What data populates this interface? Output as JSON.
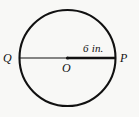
{
  "figure": {
    "type": "circle-diameter-diagram",
    "background_color": "#f8f8f6",
    "stroke_color": "#111111",
    "circle": {
      "center_x": 67.5,
      "center_y": 58,
      "radius": 48,
      "stroke_width": 2.1
    },
    "center_point": {
      "label": "O",
      "dot_radius": 1.6
    },
    "diameter": {
      "left_endpoint_label": "Q",
      "right_endpoint_label": "P",
      "left_segment_stroke_width": 1.2,
      "right_segment_stroke_width": 2.6,
      "y": 58,
      "x_start": 19.5,
      "x_end": 115.5
    },
    "measurement": {
      "text": "6 in.",
      "value": 6,
      "unit": "in.",
      "describes": "radius OP"
    }
  }
}
